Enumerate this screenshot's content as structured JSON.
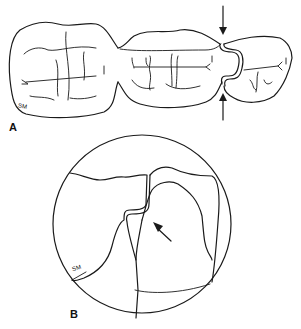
{
  "figure": {
    "panels": [
      {
        "id": "A",
        "label": "A",
        "description": "Occlusal view of three posterior teeth with contact area between middle and right tooth indicated by arrows"
      },
      {
        "id": "B",
        "label": "B",
        "description": "Magnified circular inset of interproximal contact with arrow pointing at contact"
      }
    ],
    "signature_a": "SM",
    "signature_b": "SM",
    "colors": {
      "ink": "#1a1a1a",
      "background": "#ffffff"
    }
  }
}
